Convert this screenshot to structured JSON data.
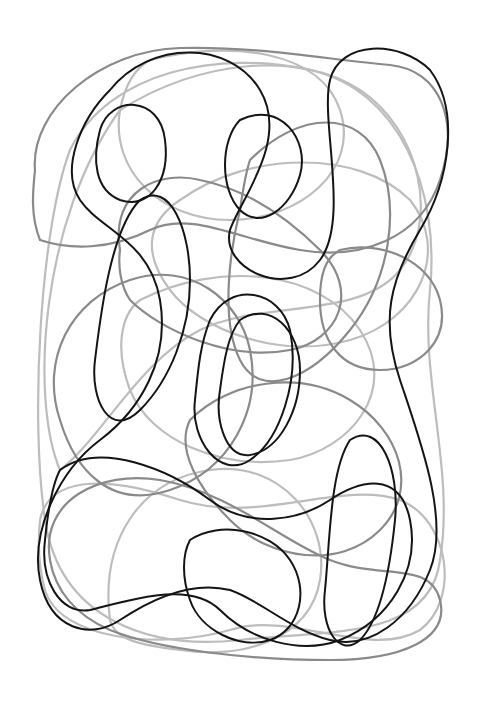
{
  "artwork": {
    "description": "Abstract tangled closed-loop line drawing on white",
    "background": "#ffffff",
    "width": 502,
    "height": 724,
    "colors": {
      "black": "#141414",
      "grey": "#8a8a8a",
      "light": "#bdbdbd"
    },
    "strokes": {
      "black": 2.0,
      "grey": 2.2,
      "light": 2.2
    },
    "paths": [
      {
        "tone": "light",
        "d": "M70 150 C40 230 30 420 45 520 C60 620 150 650 240 640 C330 630 430 640 440 560 C455 470 420 380 430 290 C440 190 400 90 310 70 C220 50 110 70 70 150 Z"
      },
      {
        "tone": "light",
        "d": "M120 110 C200 60 300 50 360 90 C420 130 440 220 400 270 C360 320 260 300 200 330 C140 360 100 440 60 470 C30 400 40 220 120 110 Z"
      },
      {
        "tone": "light",
        "d": "M180 200 C250 150 360 150 410 200 C450 250 420 320 350 340 C280 360 200 330 170 290 C140 250 150 220 180 200 Z"
      },
      {
        "tone": "light",
        "d": "M40 520 C50 470 120 480 180 500 C260 525 340 480 400 500 C450 520 460 600 420 630 C370 660 290 610 230 630 C160 650 60 640 45 590 C38 565 38 540 40 520 Z"
      },
      {
        "tone": "light",
        "d": "M140 300 C220 260 320 270 360 330 C400 390 350 450 290 460 C220 470 150 440 130 390 C115 350 120 315 140 300 Z"
      },
      {
        "tone": "light",
        "d": "M110 620 C100 540 140 480 210 470 C280 460 330 520 320 580 C310 640 240 660 180 650 C140 645 115 640 110 620 Z"
      },
      {
        "tone": "light",
        "d": "M150 60 C230 40 320 50 340 110 C360 170 300 220 230 220 C160 220 110 170 120 110 C125 85 135 68 150 60 Z"
      },
      {
        "tone": "grey",
        "d": "M35 170 C30 110 100 50 180 48 C260 46 330 60 390 65 C440 70 460 120 440 180 C420 240 360 260 300 250 C240 240 190 210 150 230 C110 250 70 250 40 240 C30 215 33 190 35 170 Z"
      },
      {
        "tone": "grey",
        "d": "M120 250 C110 190 160 170 200 180 C250 190 290 220 320 250 C360 290 340 340 290 350 C230 362 160 330 130 300 C120 285 118 265 120 250 Z"
      },
      {
        "tone": "grey",
        "d": "M60 420 C40 360 70 300 130 280 C190 260 240 300 250 350 C262 410 230 470 170 490 C110 510 75 470 60 420 Z"
      },
      {
        "tone": "grey",
        "d": "M190 420 C230 380 300 370 350 400 C400 430 420 490 380 530 C340 570 270 560 230 520 C200 490 175 450 190 420 Z"
      },
      {
        "tone": "grey",
        "d": "M50 560 C40 500 100 470 160 480 C230 492 280 540 330 560 C380 580 430 560 440 600 C450 640 400 660 330 660 C250 660 160 650 110 630 C75 615 55 590 50 560 Z"
      },
      {
        "tone": "grey",
        "d": "M250 160 C300 110 360 110 380 160 C400 210 390 280 350 330 C310 380 260 400 240 360 C220 320 230 250 240 210 C243 190 245 175 250 160 Z"
      },
      {
        "tone": "grey",
        "d": "M340 250 C380 240 430 260 440 300 C450 340 420 370 380 370 C340 370 320 340 320 300 C320 275 325 258 340 250 Z"
      },
      {
        "tone": "black",
        "d": "M110 90 C150 40 230 40 260 90 C290 140 240 200 230 230 C220 270 290 300 320 260 C350 220 320 120 330 80 C340 40 400 40 430 70 C460 110 450 180 420 230 C390 280 380 320 400 380 C420 440 450 520 430 570 C410 620 370 650 330 640 C290 630 260 600 230 590 C190 580 150 600 120 620 C90 640 50 630 40 580 C30 530 60 470 100 440 C140 410 170 360 160 300 C150 240 100 230 80 200 C60 170 80 120 110 90 Z"
      },
      {
        "tone": "black",
        "d": "M100 130 C110 95 160 95 165 140 C170 180 150 210 120 200 C95 190 92 160 100 130 Z"
      },
      {
        "tone": "black",
        "d": "M240 120 C280 100 310 140 300 175 C290 210 260 230 240 210 C220 190 220 140 240 120 Z"
      },
      {
        "tone": "black",
        "d": "M210 320 C230 280 280 290 290 330 C300 380 280 440 250 460 C220 480 190 440 195 400 C198 370 200 345 210 320 Z"
      },
      {
        "tone": "black",
        "d": "M140 200 C170 180 190 230 190 280 C190 330 170 380 140 410 C110 440 90 400 95 360 C100 320 110 230 140 200 Z"
      },
      {
        "tone": "black",
        "d": "M240 320 C270 300 300 330 300 370 C300 410 280 450 250 455 C225 458 215 420 220 390 C224 360 228 335 240 320 Z"
      },
      {
        "tone": "black",
        "d": "M350 440 C380 420 400 470 395 520 C390 570 380 620 360 640 C340 658 320 630 325 590 C330 540 330 470 350 440 Z"
      },
      {
        "tone": "black",
        "d": "M60 470 C100 440 170 470 210 500 C250 530 300 520 330 500 C360 480 400 470 410 520 C420 570 390 620 340 640 C300 655 250 640 220 610 C190 580 130 600 90 610 C60 615 40 580 45 540 C48 510 52 485 60 470 Z"
      },
      {
        "tone": "black",
        "d": "M190 540 C220 520 270 530 290 560 C310 590 300 630 270 640 C240 650 200 630 190 600 C182 578 182 555 190 540 Z"
      }
    ]
  }
}
